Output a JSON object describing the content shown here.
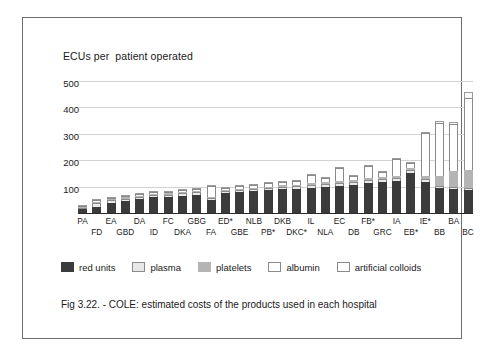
{
  "figure": {
    "axis_title": "ECUs per  patient operated",
    "caption": "Fig 3.22. - COLE: estimated costs of the products used in each hospital"
  },
  "legend": {
    "items": [
      {
        "label": "red units",
        "color": "#3b3b3b",
        "key": "red_units"
      },
      {
        "label": "plasma",
        "color": "#e8e8e8",
        "key": "plasma"
      },
      {
        "label": "platelets",
        "color": "#b4b4b4",
        "key": "platelets"
      },
      {
        "label": "albumin",
        "color": "#ffffff",
        "key": "albumin"
      },
      {
        "label": "artificial colloids",
        "color": "#ffffff",
        "key": "artificial_colloids"
      }
    ]
  },
  "chart_data": {
    "type": "bar",
    "subtype": "stacked",
    "title": "Fig 3.22. - COLE: estimated costs of the products used in each hospital",
    "xlabel": "",
    "ylabel": "ECUs per  patient operated",
    "ylim": [
      0,
      500
    ],
    "yticks": [
      100,
      200,
      300,
      400,
      500
    ],
    "grid": true,
    "legend_position": "bottom",
    "categories": [
      "PA",
      "FD",
      "EA",
      "GBD",
      "DA",
      "ID",
      "FC",
      "DKA",
      "GBG",
      "FA",
      "ED*",
      "GBE",
      "NLB",
      "PB*",
      "DKB",
      "DKC*",
      "IL",
      "NLA",
      "EC",
      "DB",
      "FB*",
      "GRC",
      "IA",
      "EB*",
      "IE*",
      "BB",
      "BA",
      "BC"
    ],
    "series": [
      {
        "name": "red units",
        "color": "#3b3b3b",
        "values": [
          14,
          22,
          38,
          44,
          52,
          60,
          62,
          66,
          70,
          48,
          74,
          78,
          82,
          86,
          90,
          92,
          96,
          100,
          104,
          108,
          112,
          116,
          120,
          150,
          118,
          96,
          92,
          86
        ]
      },
      {
        "name": "plasma",
        "color": "#e8e8e8",
        "values": [
          6,
          16,
          10,
          10,
          8,
          8,
          8,
          8,
          8,
          8,
          8,
          8,
          8,
          8,
          10,
          10,
          10,
          10,
          10,
          10,
          12,
          12,
          12,
          12,
          10,
          8,
          8,
          8
        ]
      },
      {
        "name": "platelets",
        "color": "#b4b4b4",
        "values": [
          2,
          4,
          4,
          5,
          5,
          5,
          5,
          5,
          5,
          4,
          5,
          5,
          6,
          6,
          6,
          6,
          8,
          8,
          8,
          8,
          8,
          10,
          10,
          10,
          14,
          38,
          60,
          70
        ]
      },
      {
        "name": "albumin",
        "color": "#ffffff",
        "values": [
          2,
          6,
          6,
          7,
          6,
          6,
          6,
          8,
          8,
          44,
          8,
          10,
          10,
          12,
          12,
          12,
          30,
          14,
          48,
          16,
          46,
          18,
          62,
          16,
          160,
          200,
          178,
          270
        ]
      },
      {
        "name": "artificial colloids",
        "color": "#fafafa",
        "values": [
          1,
          2,
          2,
          2,
          2,
          2,
          3,
          3,
          3,
          3,
          3,
          3,
          3,
          3,
          4,
          4,
          4,
          4,
          4,
          4,
          5,
          5,
          5,
          5,
          6,
          6,
          8,
          26
        ]
      }
    ],
    "totals": [
      25,
      50,
      60,
      68,
      73,
      81,
      84,
      90,
      94,
      107,
      98,
      104,
      109,
      115,
      122,
      124,
      148,
      136,
      174,
      146,
      183,
      161,
      209,
      193,
      308,
      348,
      346,
      460
    ]
  }
}
